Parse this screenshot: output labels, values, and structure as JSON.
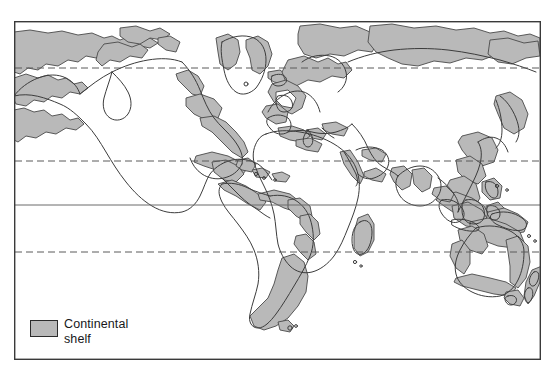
{
  "figure": {
    "type": "thematic-world-map",
    "title_visible": false,
    "background_color": "#ffffff"
  },
  "frame": {
    "x": 14,
    "y": 21,
    "width": 527,
    "height": 339,
    "border_color": "#3a3a3a",
    "border_width": 1.4
  },
  "legend": {
    "swatch_label": "Continental\nshelf",
    "swatch_fill": "#b9b9b9",
    "swatch_stroke": "#2b2b2b",
    "swatch": {
      "x": 30,
      "y": 320,
      "width": 28,
      "height": 17
    },
    "text_position": {
      "x": 64,
      "y": 317
    }
  },
  "map_style": {
    "shelf_fill": "#b9b9b9",
    "shelf_stroke": "#4a4a4a",
    "coast_stroke": "#3c3c3c",
    "coast_width": 1.0,
    "ocean_fill": "#ffffff",
    "land_fill": "#ffffff"
  },
  "graticule": {
    "lines": [
      {
        "name": "arctic-circle",
        "y": 68,
        "style": "dashed",
        "color": "#5a5a5a"
      },
      {
        "name": "tropic-of-cancer",
        "y": 161,
        "style": "dashed",
        "color": "#5a5a5a"
      },
      {
        "name": "equator",
        "y": 205,
        "style": "solid",
        "color": "#6a6a6a"
      },
      {
        "name": "tropic-of-capricorn",
        "y": 252,
        "style": "dashed",
        "color": "#5a5a5a"
      }
    ],
    "labels_visible": false
  },
  "map_data": {
    "projection": "cylindrical",
    "theme": "Continental shelf extent",
    "regions": [
      "North America",
      "Greenland",
      "South America",
      "Europe",
      "Africa",
      "Asia",
      "Siberia",
      "Southeast Asia",
      "Australia",
      "New Zealand",
      "Madagascar",
      "Caribbean"
    ]
  }
}
